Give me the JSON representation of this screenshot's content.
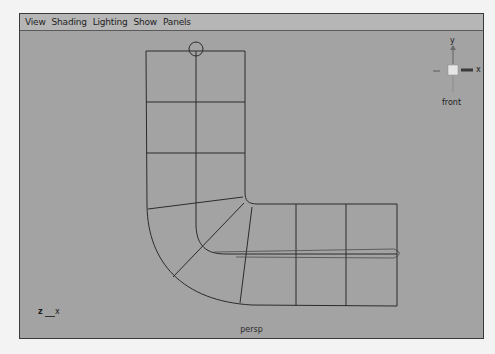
{
  "menubar": {
    "items": [
      {
        "label": "View"
      },
      {
        "label": "Shading"
      },
      {
        "label": "Lighting"
      },
      {
        "label": "Show"
      },
      {
        "label": "Panels"
      }
    ]
  },
  "view_cube": {
    "up_axis_label": "y",
    "right_axis_label": "x",
    "view_name": "front"
  },
  "axis_indicator": {
    "left_label": "z",
    "right_label": "x"
  },
  "camera_label": "persp",
  "colors": {
    "viewport_bg": "#a3a3a3",
    "menubar_bg": "#b6b6b6",
    "wireframe": "#2b2b2b"
  }
}
